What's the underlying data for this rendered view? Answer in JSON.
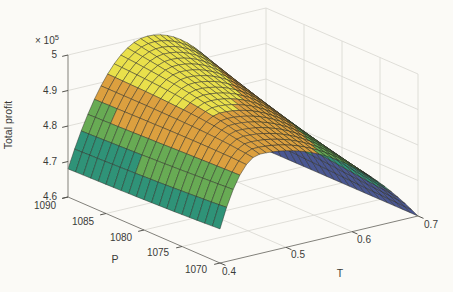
{
  "figure": {
    "width": 453,
    "height": 292,
    "background": "#fbfaf6",
    "colors": {
      "grid": "#d8d7d1",
      "axis_line": "#82817b",
      "tick_mark": "#55544f",
      "label_text": "#3a3a38",
      "mesh_edge": "#2a2a22"
    }
  },
  "chart_data": {
    "type": "3d-surface",
    "title": "",
    "colormap": {
      "name": "parula-5-band",
      "band_colors": [
        "#4a5792",
        "#2f9378",
        "#68ab54",
        "#dca03f",
        "#e9e04b"
      ],
      "band_edges_1e5": [
        4.6,
        4.68,
        4.76,
        4.84,
        4.92,
        5.001
      ]
    },
    "axes": {
      "x": {
        "label": "T",
        "range": [
          0.4,
          0.7
        ],
        "ticks": [
          "0.4",
          "0.5",
          "0.6",
          "0.7"
        ],
        "tick_values": [
          0.4,
          0.5,
          0.6,
          0.7
        ]
      },
      "y": {
        "label": "P",
        "range": [
          1070,
          1090
        ],
        "ticks": [
          "1090",
          "1085",
          "1080",
          "1075",
          "1070"
        ],
        "tick_values": [
          1090,
          1085,
          1080,
          1075,
          1070
        ]
      },
      "z": {
        "label": "Total profit",
        "multiplier_base": "× 10",
        "multiplier_exp": "5",
        "range_1e5": [
          4.6,
          5.0
        ],
        "ticks": [
          "4.6",
          "4.7",
          "4.8",
          "4.9",
          "5"
        ],
        "tick_values_1e5": [
          4.6,
          4.7,
          4.8,
          4.9,
          5.0
        ]
      }
    },
    "surface": {
      "description": "Ridge-shaped total profit surface: concave in T with a peak moving from T=0.52 at P=1090 down to T=0.46 at P=1070; maximum profit 5.0e5 at (P=1090, T=0.52); profit falls to 4.6e5 along the T=0.7 edge.",
      "model": {
        "z_base_1e5": 4.6,
        "P_range": [
          1070,
          1090
        ],
        "T_range": [
          0.4,
          0.7
        ],
        "peak": {
          "z_at_P1090": 5.0,
          "z_at_P1070": 4.88,
          "T_at_P1090": 0.52,
          "T_at_P1070": 0.46
        },
        "half_width_left": {
          "at_P1090": 0.134,
          "at_P1070": 0.074
        },
        "half_width_right": {
          "at_P1090": 0.18,
          "at_P1070": 0.24
        },
        "mesh_step": {
          "P": 1,
          "T": 0.01
        }
      },
      "sample_grid_1e5": {
        "T": [
          0.4,
          0.45,
          0.5,
          0.55,
          0.6,
          0.65,
          0.7
        ],
        "rows": [
          {
            "P": 1090,
            "z": [
              4.68,
              4.89,
              4.99,
              4.99,
              4.92,
              4.79,
              4.6
            ]
          },
          {
            "P": 1085,
            "z": [
              4.68,
              4.89,
              4.97,
              4.95,
              4.88,
              4.77,
              4.6
            ]
          },
          {
            "P": 1080,
            "z": [
              4.69,
              4.89,
              4.94,
              4.91,
              4.85,
              4.74,
              4.6
            ]
          },
          {
            "P": 1075,
            "z": [
              4.69,
              4.89,
              4.91,
              4.88,
              4.81,
              4.72,
              4.6
            ]
          },
          {
            "P": 1070,
            "z": [
              4.7,
              4.88,
              4.87,
              4.84,
              4.79,
              4.7,
              4.6
            ]
          }
        ]
      },
      "key_points": {
        "peak": {
          "P": 1090,
          "T": 0.52,
          "total_profit": 500000
        },
        "minimum_edge": {
          "T": 0.7,
          "total_profit": 460000
        }
      }
    },
    "legend": null,
    "grid": true
  }
}
